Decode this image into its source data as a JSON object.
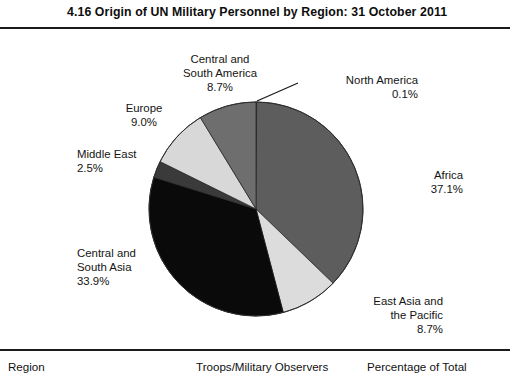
{
  "figure": {
    "number": "4.16",
    "title": "4.16  Origin of UN Military Personnel by Region: 31 October 2011"
  },
  "chart_data": {
    "type": "pie",
    "title": "4.16  Origin of UN Military Personnel by Region: 31 October 2011",
    "categories": [
      "North America",
      "Africa",
      "East Asia and the Pacific",
      "Central and South Asia",
      "Middle East",
      "Europe",
      "Central and South America"
    ],
    "values": [
      0.1,
      37.1,
      8.7,
      33.9,
      2.5,
      9.0,
      8.7
    ],
    "value_labels": [
      "0.1%",
      "37.1%",
      "8.7%",
      "33.9%",
      "2.5%",
      "9.0%",
      "8.7%"
    ],
    "unit": "percent",
    "start_angle_deg": 0,
    "direction": "clockwise",
    "legend": "none",
    "grid": false,
    "colors": [
      "#5a5a5a",
      "#5d5d5d",
      "#dcdcdc",
      "#0a0a0a",
      "#3a3a3a",
      "#d8d8d8",
      "#6e6e6e"
    ],
    "slices": [
      {
        "label": "North America",
        "pct": "0.1%",
        "value": 0.1,
        "color": "#5a5a5a",
        "leader_line": true
      },
      {
        "label": "Africa",
        "pct": "37.1%",
        "value": 37.1,
        "color": "#5d5d5d",
        "leader_line": false
      },
      {
        "label": "East Asia and the Pacific",
        "pct": "8.7%",
        "value": 8.7,
        "color": "#dcdcdc",
        "leader_line": false
      },
      {
        "label": "Central and South Asia",
        "pct": "33.9%",
        "value": 33.9,
        "color": "#0a0a0a",
        "leader_line": false
      },
      {
        "label": "Middle East",
        "pct": "2.5%",
        "value": 2.5,
        "color": "#3a3a3a",
        "leader_line": false
      },
      {
        "label": "Europe",
        "pct": "9.0%",
        "value": 9.0,
        "color": "#d8d8d8",
        "leader_line": false
      },
      {
        "label": "Central and South America",
        "pct": "8.7%",
        "value": 8.7,
        "color": "#6e6e6e",
        "leader_line": false
      }
    ]
  },
  "labels": {
    "central_south_america": {
      "line1": "Central and",
      "line2": "South America",
      "pct": "8.7%"
    },
    "north_america": {
      "line1": "North America",
      "pct": "0.1%"
    },
    "europe": {
      "line1": "Europe",
      "pct": "9.0%"
    },
    "middle_east": {
      "line1": "Middle East",
      "pct": "2.5%"
    },
    "africa": {
      "line1": "Africa",
      "pct": "37.1%"
    },
    "central_south_asia": {
      "line1": "Central and",
      "line2": "South Asia",
      "pct": "33.9%"
    },
    "east_asia_pacific": {
      "line1": "East Asia and",
      "line2": "the Pacific",
      "pct": "8.7%"
    }
  },
  "table": {
    "headers": {
      "region": "Region",
      "troops": "Troops/Military Observers",
      "percentage": "Percentage of Total"
    }
  }
}
